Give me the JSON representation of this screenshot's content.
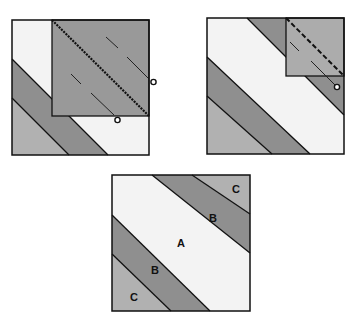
{
  "colors": {
    "white_band": "#f3f3f3",
    "mid_band": "#8f8f8f",
    "light_band": "#b1b1b1",
    "folded_square_panel1": "#999999",
    "folded_square_panel2": "#acacac",
    "outline": "#111111",
    "background": "#ffffff"
  },
  "panels": [
    {
      "id": "step-1",
      "description": "Block with upper-right square folded over along dotted diagonal, dashed fold lines and circle markers"
    },
    {
      "id": "step-2",
      "description": "Block with smaller corner square folded along dashed diagonal, one circle marker"
    },
    {
      "id": "step-3",
      "description": "Finished diagonal-band block with labeled sections"
    }
  ],
  "labels": {
    "c_top": "C",
    "b_top": "B",
    "a_center": "A",
    "b_bottom": "B",
    "c_bottom": "C"
  }
}
